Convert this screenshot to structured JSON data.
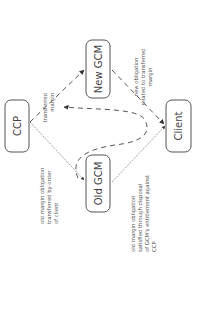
{
  "diagram": {
    "nodes": [
      {
        "id": "ccp",
        "label": "CCP"
      },
      {
        "id": "new_gcm",
        "label": "New GCM"
      },
      {
        "id": "old_gcm",
        "label": "Old GCM"
      },
      {
        "id": "client",
        "label": "Client"
      }
    ],
    "edge_labels": {
      "ccp_to_new_gcm": [
        "transferred",
        "margin"
      ],
      "new_gcm_to_client": [
        "new obligation",
        "related to transferred",
        "margin"
      ],
      "ccp_to_old_gcm": [
        "old margin obligation",
        "transferred by order",
        "of client"
      ],
      "old_gcm_to_client": [
        "old margin obligation",
        "satisfied through disposal",
        "of GCM's entitlement against",
        "CCP"
      ]
    },
    "edges": [
      {
        "from": "ccp",
        "to": "new_gcm",
        "style": "dashed"
      },
      {
        "from": "new_gcm",
        "to": "client",
        "style": "dashed"
      },
      {
        "from": "ccp",
        "to": "old_gcm",
        "style": "dotted"
      },
      {
        "from": "old_gcm",
        "to": "client",
        "style": "dotted"
      },
      {
        "from": "old_gcm",
        "to": "ccp",
        "style": "dashed-curve"
      }
    ]
  }
}
